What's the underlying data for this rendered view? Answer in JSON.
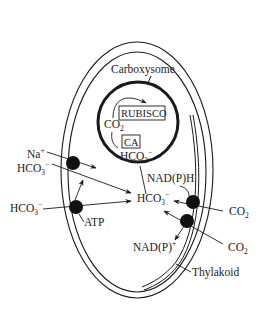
{
  "diagram": {
    "colors": {
      "ink": "#1a1a1a",
      "background": "#ffffff"
    },
    "labels": {
      "carboxysome": "Carboxysome",
      "rubisco": "RUBISCO",
      "ca": "CA",
      "co2_inner": {
        "base": "CO",
        "sub": "2"
      },
      "hco3_inner": {
        "base": "HCO",
        "sub": "3",
        "sup": "−"
      },
      "na": {
        "base": "Na",
        "sup": "+"
      },
      "hco3_top_left": {
        "base": "HCO",
        "sub": "3",
        "sup": "−"
      },
      "hco3_bottom_left": {
        "base": "HCO",
        "sub": "3",
        "sup": "−"
      },
      "hco3_cytosol": {
        "base": "HCO",
        "sub": "3",
        "sup": "−"
      },
      "atp": "ATP",
      "nadph": "NAD(P)H",
      "nadp": {
        "base": "NAD(P)",
        "sup": "+"
      },
      "co2_right_top": {
        "base": "CO",
        "sub": "2"
      },
      "co2_right_bottom": {
        "base": "CO",
        "sub": "2"
      },
      "thylakoid": "Thylakoid"
    },
    "transporters": [
      {
        "name": "Na-dependent HCO3 transporter"
      },
      {
        "name": "ATP-dependent HCO3 transporter"
      },
      {
        "name": "CO2 uptake complex 1"
      },
      {
        "name": "CO2 uptake complex 2"
      }
    ]
  }
}
